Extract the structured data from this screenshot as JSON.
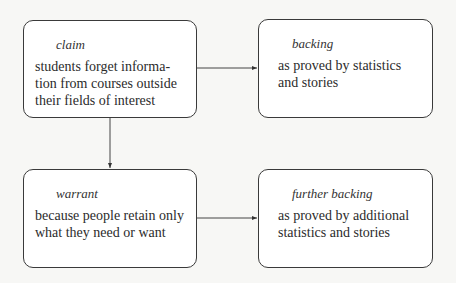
{
  "diagram": {
    "nodes": [
      {
        "id": "claim",
        "label": "claim",
        "text": "students forget informa-\ntion from courses outside\ntheir fields of interest"
      },
      {
        "id": "backing",
        "label": "backing",
        "text": "as proved by statistics\nand stories"
      },
      {
        "id": "warrant",
        "label": "warrant",
        "text": "because people retain only\nwhat they need or want"
      },
      {
        "id": "further-backing",
        "label": "further backing",
        "text": "as proved by additional\nstatistics and stories"
      }
    ],
    "edges": [
      {
        "from": "claim",
        "to": "backing"
      },
      {
        "from": "claim",
        "to": "warrant"
      },
      {
        "from": "warrant",
        "to": "further-backing"
      }
    ]
  }
}
